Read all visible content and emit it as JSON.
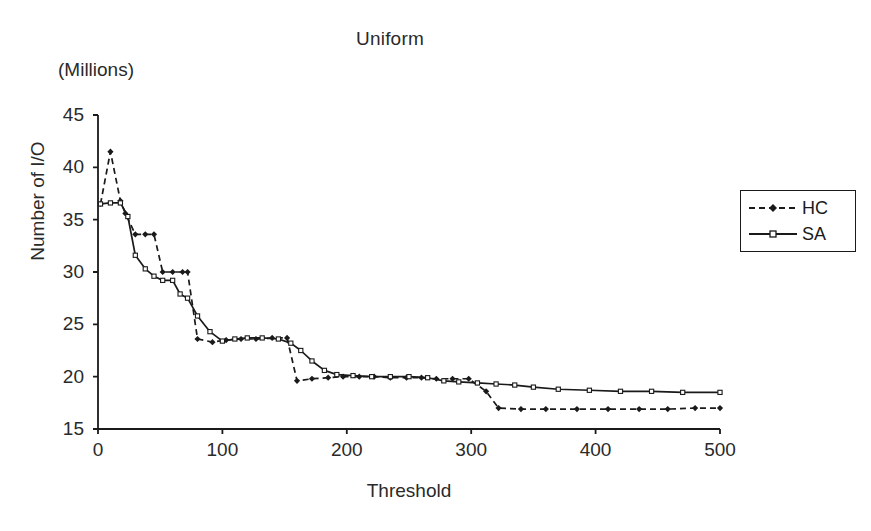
{
  "chart_data": {
    "type": "line",
    "title": "Uniform",
    "units_note": "(Millions)",
    "xlabel": "Threshold",
    "ylabel": "Number of I/O",
    "xlim": [
      0,
      500
    ],
    "ylim": [
      15,
      45
    ],
    "xticks": [
      0,
      100,
      200,
      300,
      400,
      500
    ],
    "yticks": [
      15,
      20,
      25,
      30,
      35,
      40,
      45
    ],
    "grid": false,
    "legend_position": "right",
    "series": [
      {
        "name": "HC",
        "style": "dashed",
        "marker": "filled-diamond",
        "color": "#1a1a1a",
        "points": [
          [
            2,
            36.5
          ],
          [
            10,
            41.5
          ],
          [
            18,
            36.8
          ],
          [
            22,
            35.6
          ],
          [
            30,
            33.6
          ],
          [
            38,
            33.6
          ],
          [
            45,
            33.6
          ],
          [
            52,
            30.0
          ],
          [
            60,
            30.0
          ],
          [
            68,
            30.0
          ],
          [
            72,
            30.0
          ],
          [
            80,
            23.6
          ],
          [
            92,
            23.3
          ],
          [
            103,
            23.5
          ],
          [
            115,
            23.6
          ],
          [
            127,
            23.6
          ],
          [
            140,
            23.7
          ],
          [
            152,
            23.7
          ],
          [
            160,
            19.6
          ],
          [
            172,
            19.8
          ],
          [
            185,
            19.9
          ],
          [
            197,
            20.0
          ],
          [
            210,
            20.0
          ],
          [
            222,
            20.0
          ],
          [
            235,
            19.9
          ],
          [
            248,
            19.9
          ],
          [
            260,
            19.9
          ],
          [
            272,
            19.8
          ],
          [
            285,
            19.8
          ],
          [
            298,
            19.8
          ],
          [
            312,
            18.6
          ],
          [
            322,
            17.0
          ],
          [
            340,
            16.9
          ],
          [
            360,
            16.9
          ],
          [
            385,
            16.9
          ],
          [
            410,
            16.9
          ],
          [
            435,
            16.9
          ],
          [
            458,
            16.9
          ],
          [
            480,
            17.0
          ],
          [
            500,
            17.0
          ]
        ]
      },
      {
        "name": "SA",
        "style": "solid",
        "marker": "open-square",
        "color": "#1a1a1a",
        "points": [
          [
            2,
            36.5
          ],
          [
            10,
            36.6
          ],
          [
            18,
            36.6
          ],
          [
            24,
            35.3
          ],
          [
            30,
            31.6
          ],
          [
            38,
            30.3
          ],
          [
            45,
            29.6
          ],
          [
            52,
            29.2
          ],
          [
            60,
            29.2
          ],
          [
            66,
            27.9
          ],
          [
            72,
            27.5
          ],
          [
            80,
            25.8
          ],
          [
            90,
            24.3
          ],
          [
            100,
            23.4
          ],
          [
            110,
            23.6
          ],
          [
            120,
            23.7
          ],
          [
            132,
            23.7
          ],
          [
            145,
            23.6
          ],
          [
            155,
            23.2
          ],
          [
            163,
            22.5
          ],
          [
            172,
            21.5
          ],
          [
            182,
            20.6
          ],
          [
            192,
            20.2
          ],
          [
            205,
            20.1
          ],
          [
            220,
            20.0
          ],
          [
            235,
            20.0
          ],
          [
            250,
            20.0
          ],
          [
            265,
            19.9
          ],
          [
            278,
            19.6
          ],
          [
            290,
            19.5
          ],
          [
            305,
            19.4
          ],
          [
            320,
            19.3
          ],
          [
            335,
            19.2
          ],
          [
            350,
            19.0
          ],
          [
            370,
            18.8
          ],
          [
            395,
            18.7
          ],
          [
            420,
            18.6
          ],
          [
            445,
            18.6
          ],
          [
            470,
            18.5
          ],
          [
            500,
            18.5
          ]
        ]
      }
    ]
  },
  "legend": {
    "entries": [
      {
        "label": "HC"
      },
      {
        "label": "SA"
      }
    ]
  }
}
